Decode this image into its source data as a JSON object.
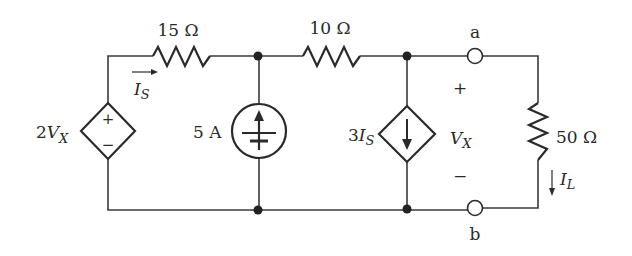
{
  "components": {
    "r1": {
      "label": "15 Ω",
      "value": "15",
      "unit": "Ω"
    },
    "r2": {
      "label": "10 Ω",
      "value": "10",
      "unit": "Ω"
    },
    "r_load": {
      "label": "50 Ω",
      "value": "50",
      "unit": "Ω"
    },
    "current_source": {
      "label": "5 A"
    },
    "dep_voltage_source": {
      "coef": "2",
      "var": "V",
      "sub": "X",
      "plus": "+",
      "minus": "−"
    },
    "dep_current_source": {
      "coef": "3",
      "var": "I",
      "sub": "S"
    }
  },
  "annotations": {
    "is_label": {
      "var": "I",
      "sub": "S"
    },
    "il_label": {
      "var": "I",
      "sub": "L"
    },
    "vx_label": {
      "var": "V",
      "sub": "X",
      "plus": "+",
      "minus": "−"
    },
    "terminal_a": "a",
    "terminal_b": "b"
  }
}
